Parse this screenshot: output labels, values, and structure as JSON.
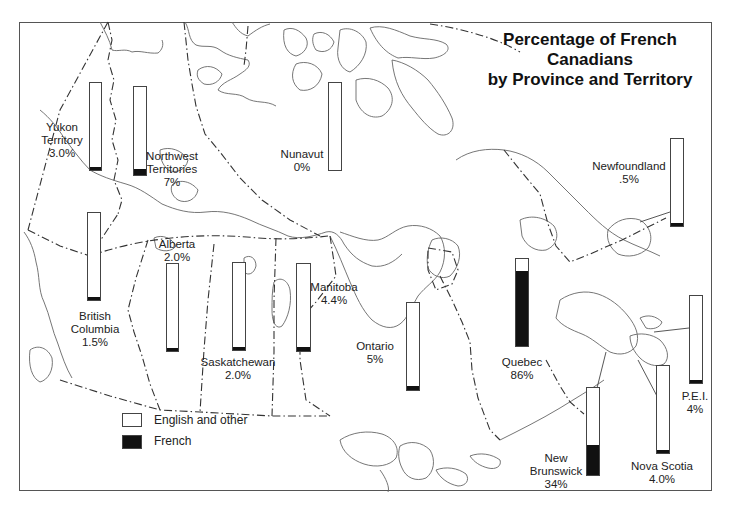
{
  "title_line1": "Percentage of French Canadians",
  "title_line2": "by Province and Territory",
  "legend": [
    {
      "label": "English and other",
      "color": "#ffffff"
    },
    {
      "label": "French",
      "color": "#111111"
    }
  ],
  "regions": [
    {
      "name": "Yukon Territory",
      "line1": "Yukon",
      "line2": "Territory",
      "value_label": "3.0%",
      "french_pct": 3.0
    },
    {
      "name": "Northwest Territories",
      "line1": "Northwest",
      "line2": "Territories",
      "value_label": "7%",
      "french_pct": 7
    },
    {
      "name": "Nunavut",
      "line1": "Nunavut",
      "line2": "",
      "value_label": "0%",
      "french_pct": 0
    },
    {
      "name": "Newfoundland",
      "line1": "Newfoundland",
      "line2": "",
      "value_label": ".5%",
      "french_pct": 0.5
    },
    {
      "name": "British Columbia",
      "line1": "British",
      "line2": "Columbia",
      "value_label": "1.5%",
      "french_pct": 1.5
    },
    {
      "name": "Alberta",
      "line1": "Alberta",
      "line2": "",
      "value_label": "2.0%",
      "french_pct": 2.0
    },
    {
      "name": "Saskatchewan",
      "line1": "Saskatchewan",
      "line2": "",
      "value_label": "2.0%",
      "french_pct": 2.0
    },
    {
      "name": "Manitoba",
      "line1": "Manitoba",
      "line2": "",
      "value_label": "4.4%",
      "french_pct": 4.4
    },
    {
      "name": "Ontario",
      "line1": "Ontario",
      "line2": "",
      "value_label": "5%",
      "french_pct": 5
    },
    {
      "name": "Quebec",
      "line1": "Quebec",
      "line2": "",
      "value_label": "86%",
      "french_pct": 86
    },
    {
      "name": "New Brunswick",
      "line1": "New",
      "line2": "Brunswick",
      "value_label": "34%",
      "french_pct": 34
    },
    {
      "name": "Nova Scotia",
      "line1": "Nova Scotia",
      "line2": "",
      "value_label": "4.0%",
      "french_pct": 4.0
    },
    {
      "name": "P.E.I.",
      "line1": "P.E.I.",
      "line2": "",
      "value_label": "4%",
      "french_pct": 4
    }
  ],
  "chart_data": {
    "type": "bar",
    "title": "Percentage of French Canadians by Province and Territory",
    "orientation": "vertical stacked (100%) bars placed on a map of Canada",
    "categories": [
      "Yukon Territory",
      "Northwest Territories",
      "Nunavut",
      "Newfoundland",
      "British Columbia",
      "Alberta",
      "Saskatchewan",
      "Manitoba",
      "Ontario",
      "Quebec",
      "New Brunswick",
      "Nova Scotia",
      "P.E.I."
    ],
    "series": [
      {
        "name": "French",
        "color": "#111111",
        "values": [
          3.0,
          7,
          0,
          0.5,
          1.5,
          2.0,
          2.0,
          4.4,
          5,
          86,
          34,
          4.0,
          4
        ]
      },
      {
        "name": "English and other",
        "color": "#ffffff",
        "values": [
          97.0,
          93,
          100,
          99.5,
          98.5,
          98.0,
          98.0,
          95.6,
          95,
          14,
          66,
          96.0,
          96
        ]
      }
    ],
    "value_labels": [
      "3.0%",
      "7%",
      "0%",
      ".5%",
      "1.5%",
      "2.0%",
      "2.0%",
      "4.4%",
      "5%",
      "86%",
      "34%",
      "4.0%",
      "4%"
    ],
    "xlabel": "",
    "ylabel": "",
    "ylim": [
      0,
      100
    ],
    "grid": false,
    "legend_position": "lower-left"
  }
}
